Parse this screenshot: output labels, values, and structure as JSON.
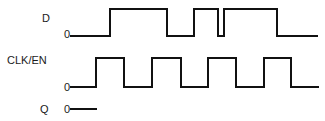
{
  "diagram": {
    "type": "timing-diagram",
    "signals": [
      {
        "name": "D",
        "zero_label": "0",
        "label_pos": [
          42,
          22
        ],
        "zero_pos": [
          64,
          38
        ],
        "high_y": 9,
        "low_y": 36,
        "x_start": 70,
        "x_end": 318,
        "transitions": [
          110,
          167,
          194,
          218,
          224,
          277
        ],
        "initial": "low"
      },
      {
        "name": "CLK/EN",
        "zero_label": "0",
        "label_pos": [
          7,
          64
        ],
        "zero_pos": [
          64,
          91
        ],
        "high_y": 58,
        "low_y": 87,
        "x_start": 70,
        "x_end": 319,
        "transitions": [
          96,
          124,
          152,
          181,
          208,
          236,
          264,
          291
        ],
        "initial": "low"
      },
      {
        "name": "Q",
        "zero_label": "0",
        "label_pos": [
          40,
          113
        ],
        "zero_pos": [
          64,
          113
        ],
        "high_y": 109,
        "low_y": 109,
        "x_start": 70,
        "x_end": 97,
        "transitions": [],
        "initial": "low"
      }
    ],
    "colors": {
      "line": "#111111",
      "text": "#1a1a1a",
      "background": "#ffffff"
    }
  }
}
